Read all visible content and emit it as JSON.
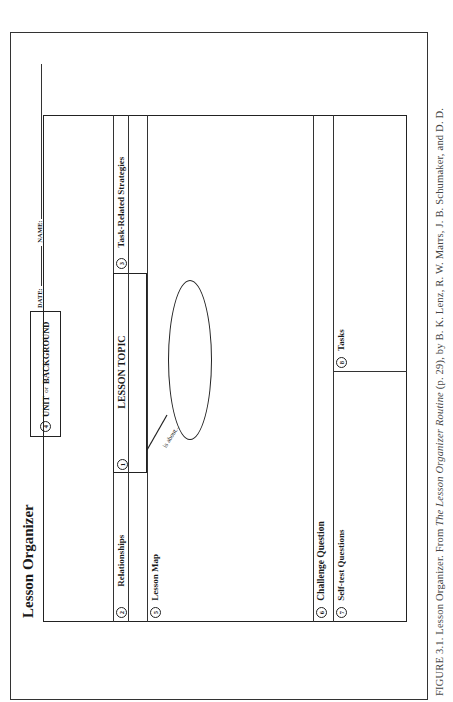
{
  "document": {
    "title": "Lesson Organizer",
    "header": {
      "unit_number": "4",
      "unit_label": "UNIT",
      "unit_or": "or",
      "background_label": "BACKGROUND",
      "date_label": "DATE:",
      "name_label": "NAME:"
    },
    "sections": [
      {
        "number": "2",
        "label": "Relationships"
      },
      {
        "number": "1",
        "label": "LESSON TOPIC"
      },
      {
        "number": "3",
        "label": "Task-Related  Strategies"
      },
      {
        "number": "5",
        "label": "Lesson Map"
      },
      {
        "number": "6",
        "label": "Challenge Question"
      },
      {
        "number": "7",
        "label": "Self-test Questions"
      },
      {
        "number": "8",
        "label": "Tasks"
      }
    ],
    "map_connector_label": "is about..."
  },
  "caption": {
    "prefix": "FIGURE 3.1.  Lesson Organizer. From ",
    "source_title": "The Lesson Organizer Routine",
    "suffix": " (p. 29), by B. K. Lenz, R. W. Marrs, J. B. Schumaker, and D. D."
  }
}
